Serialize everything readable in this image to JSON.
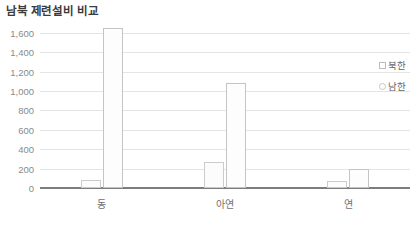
{
  "chart_data": {
    "type": "bar",
    "title": "남북 제련설비 비교",
    "xlabel": "",
    "ylabel": "",
    "categories": [
      "동",
      "아연",
      "연"
    ],
    "series": [
      {
        "name": "북한",
        "values": [
          80,
          270,
          70
        ],
        "marker": "square-outline"
      },
      {
        "name": "남한",
        "values": [
          1650,
          1080,
          200
        ],
        "marker": "circle-outline"
      }
    ],
    "ylim": [
      0,
      1700
    ],
    "yticks": [
      0,
      200,
      400,
      600,
      800,
      1000,
      1200,
      1400,
      1600
    ],
    "ytick_labels": [
      "0",
      "200",
      "400",
      "600",
      "800",
      "1,000",
      "1,200",
      "1,400",
      "1,600"
    ],
    "grid": true,
    "legend_position": "right",
    "colors": {
      "bar_fill": "#fcfcfc",
      "bar_border": "#c9c9c9",
      "gridline": "#e4e4e4",
      "axis": "#7d7d7d",
      "title_text": "#3a3a3a",
      "tick_text": "#8a8a8a"
    }
  }
}
